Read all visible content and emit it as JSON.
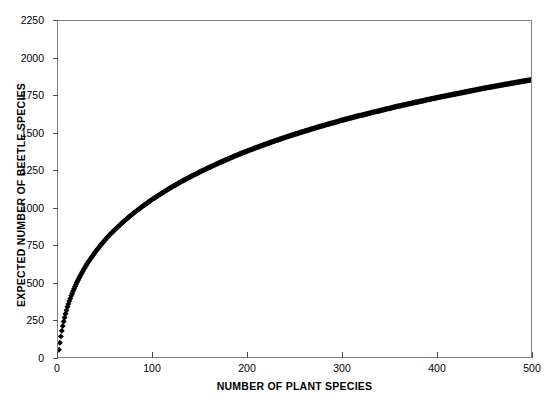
{
  "chart_data": {
    "type": "scatter",
    "title": "",
    "xlabel": "NUMBER OF PLANT SPECIES",
    "ylabel": "EXPECTED NUMBER OF BEETLE SPECIES",
    "xlim": [
      0,
      500
    ],
    "ylim": [
      0,
      2250
    ],
    "xticks": [
      0,
      100,
      200,
      300,
      400,
      500
    ],
    "yticks": [
      0,
      250,
      500,
      750,
      1000,
      1250,
      1500,
      1750,
      2000,
      2250
    ],
    "grid": false,
    "legend": null,
    "marker": {
      "shape": "diamond",
      "color": "#000000",
      "size": 3
    },
    "series": [
      {
        "name": "Expected beetle species",
        "x": [
          1,
          2,
          3,
          4,
          5,
          6,
          7,
          8,
          9,
          10,
          12,
          14,
          16,
          18,
          20,
          24,
          28,
          32,
          36,
          40,
          45,
          50,
          55,
          60,
          70,
          80,
          90,
          100,
          110,
          120,
          130,
          140,
          150,
          160,
          170,
          180,
          190,
          200,
          215,
          230,
          245,
          260,
          275,
          290,
          300,
          315,
          330,
          345,
          360,
          375,
          390,
          400,
          415,
          430,
          445,
          460,
          475,
          490,
          500
        ],
        "y": [
          48,
          95,
          138,
          175,
          208,
          238,
          265,
          290,
          313,
          336,
          375,
          410,
          442,
          472,
          500,
          550,
          595,
          636,
          673,
          708,
          748,
          786,
          820,
          852,
          911,
          964,
          1012,
          1057,
          1098,
          1137,
          1173,
          1207,
          1239,
          1270,
          1299,
          1327,
          1354,
          1379,
          1415,
          1449,
          1481,
          1511,
          1540,
          1567,
          1585,
          1610,
          1634,
          1657,
          1680,
          1701,
          1722,
          1736,
          1755,
          1774,
          1793,
          1811,
          1828,
          1845,
          1856
        ]
      }
    ]
  }
}
